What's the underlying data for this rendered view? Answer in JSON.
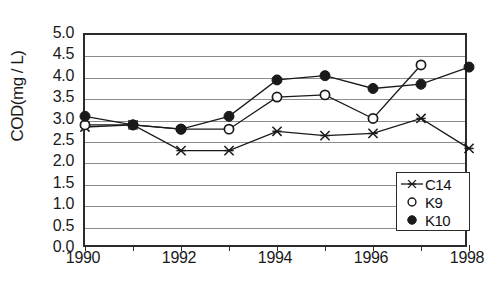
{
  "chart_data": {
    "type": "line",
    "title": "",
    "xlabel": "",
    "ylabel": "COD(mg / L)",
    "x": [
      1990,
      1991,
      1992,
      1993,
      1994,
      1995,
      1996,
      1997,
      1998
    ],
    "xtick_labels": [
      "1990",
      "1992",
      "1994",
      "1996",
      "1998"
    ],
    "xtick_values": [
      1990,
      1992,
      1994,
      1996,
      1998
    ],
    "ytick_labels": [
      "0.0",
      "0.5",
      "1.0",
      "1.5",
      "2.0",
      "2.5",
      "3.0",
      "3.5",
      "4.0",
      "4.5",
      "5.0"
    ],
    "ytick_values": [
      0.0,
      0.5,
      1.0,
      1.5,
      2.0,
      2.5,
      3.0,
      3.5,
      4.0,
      4.5,
      5.0
    ],
    "xlim": [
      1990,
      1998
    ],
    "ylim": [
      0.0,
      5.0
    ],
    "grid": "horizontal",
    "legend_position": "bottom-right",
    "series": [
      {
        "name": "C14",
        "marker": "cross-star",
        "color": "#1a1a1a",
        "x": [
          1990,
          1991,
          1992,
          1993,
          1994,
          1995,
          1996,
          1997,
          1998
        ],
        "values": [
          2.85,
          2.9,
          2.3,
          2.3,
          2.75,
          2.65,
          2.7,
          3.05,
          2.35
        ]
      },
      {
        "name": "K9",
        "marker": "open-circle",
        "color": "#1a1a1a",
        "x": [
          1990,
          1991,
          1992,
          1993,
          1994,
          1995,
          1996,
          1997
        ],
        "values": [
          2.9,
          2.9,
          2.8,
          2.8,
          3.55,
          3.6,
          3.05,
          4.3
        ]
      },
      {
        "name": "K10",
        "marker": "filled-circle",
        "color": "#1a1a1a",
        "x": [
          1990,
          1991,
          1992,
          1993,
          1994,
          1995,
          1996,
          1997,
          1998
        ],
        "values": [
          3.1,
          2.9,
          2.8,
          3.1,
          3.95,
          4.05,
          3.75,
          3.85,
          4.25
        ]
      }
    ]
  },
  "legend": {
    "entries": [
      {
        "label": "C14",
        "marker": "cross-star"
      },
      {
        "label": "K9",
        "marker": "open-circle"
      },
      {
        "label": "K10",
        "marker": "filled-circle"
      }
    ]
  }
}
